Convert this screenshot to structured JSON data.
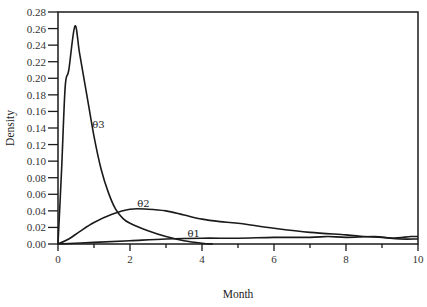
{
  "chart_data": {
    "type": "line",
    "title": "",
    "xlabel": "Month",
    "ylabel": "Density",
    "xlim": [
      0,
      10
    ],
    "ylim": [
      0,
      0.28
    ],
    "grid": false,
    "legend": "inline labels",
    "x_ticks": [
      0,
      2,
      4,
      6,
      8,
      10
    ],
    "x_tick_labels": [
      "0",
      "2",
      "4",
      "6",
      "8",
      "10"
    ],
    "x_minor_ticks": [
      1,
      3,
      5,
      7,
      9
    ],
    "y_ticks": [
      0,
      0.02,
      0.04,
      0.06,
      0.08,
      0.1,
      0.12,
      0.14,
      0.16,
      0.18,
      0.2,
      0.22,
      0.24,
      0.26,
      0.28
    ],
    "y_tick_labels": [
      "0.00",
      "0.02",
      "0.04",
      "0.06",
      "0.08",
      "0.10",
      "0.12",
      "0.14",
      "0.16",
      "0.18",
      "0.20",
      "0.22",
      "0.24",
      "0.26",
      "0.28"
    ],
    "series": [
      {
        "name": "θ1",
        "label_pos": {
          "x": 3.6,
          "y": 0.009
        },
        "points": [
          [
            0,
            0.0
          ],
          [
            1,
            0.002
          ],
          [
            2,
            0.004
          ],
          [
            3,
            0.006
          ],
          [
            4,
            0.007
          ],
          [
            5,
            0.007
          ],
          [
            6,
            0.008
          ],
          [
            7,
            0.008
          ],
          [
            7.5,
            0.009
          ],
          [
            8,
            0.008
          ],
          [
            8.8,
            0.009
          ],
          [
            9.3,
            0.007
          ],
          [
            9.8,
            0.009
          ],
          [
            10,
            0.009
          ]
        ]
      },
      {
        "name": "θ2",
        "label_pos": {
          "x": 2.2,
          "y": 0.045
        },
        "points": [
          [
            0,
            0.0
          ],
          [
            0.3,
            0.006
          ],
          [
            0.6,
            0.015
          ],
          [
            1.0,
            0.026
          ],
          [
            1.5,
            0.036
          ],
          [
            2.0,
            0.042
          ],
          [
            2.5,
            0.042
          ],
          [
            3.0,
            0.04
          ],
          [
            3.5,
            0.035
          ],
          [
            4.0,
            0.03
          ],
          [
            4.5,
            0.027
          ],
          [
            5.0,
            0.025
          ],
          [
            6.0,
            0.019
          ],
          [
            7.0,
            0.014
          ],
          [
            8.0,
            0.011
          ],
          [
            8.5,
            0.009
          ],
          [
            9.0,
            0.008
          ],
          [
            9.5,
            0.006
          ],
          [
            10,
            0.006
          ]
        ]
      },
      {
        "name": "θ3",
        "label_pos": {
          "x": 0.95,
          "y": 0.14
        },
        "points": [
          [
            0,
            0.0
          ],
          [
            0.1,
            0.09
          ],
          [
            0.2,
            0.19
          ],
          [
            0.3,
            0.21
          ],
          [
            0.47,
            0.263
          ],
          [
            0.6,
            0.23
          ],
          [
            0.8,
            0.18
          ],
          [
            1.0,
            0.13
          ],
          [
            1.2,
            0.09
          ],
          [
            1.4,
            0.062
          ],
          [
            1.6,
            0.042
          ],
          [
            1.8,
            0.031
          ],
          [
            2.0,
            0.025
          ],
          [
            2.5,
            0.016
          ],
          [
            3.0,
            0.009
          ],
          [
            3.5,
            0.004
          ],
          [
            4.0,
            0.001
          ],
          [
            4.3,
            0.0
          ]
        ]
      }
    ]
  }
}
